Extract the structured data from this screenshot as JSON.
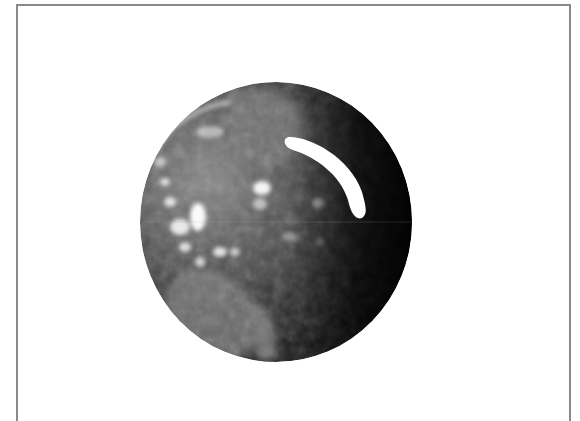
{
  "image": {
    "subject": "grayscale satellite view of Earth globe",
    "overlay": "white curved arc on upper-right of globe",
    "background_color": "#ffffff",
    "frame_color": "#8a8a8a"
  },
  "globe": {
    "center": [
      276,
      222
    ],
    "radius_x": 136,
    "radius_y": 140,
    "shading": {
      "lit_side": "left",
      "dark_side": "right",
      "lit_color": "#9a9a9a",
      "mid_color": "#4a4a4a",
      "dark_color": "#050505"
    }
  },
  "arc_overlay": {
    "color": "#ffffff",
    "start": [
      290,
      135
    ],
    "end": [
      362,
      218
    ]
  }
}
